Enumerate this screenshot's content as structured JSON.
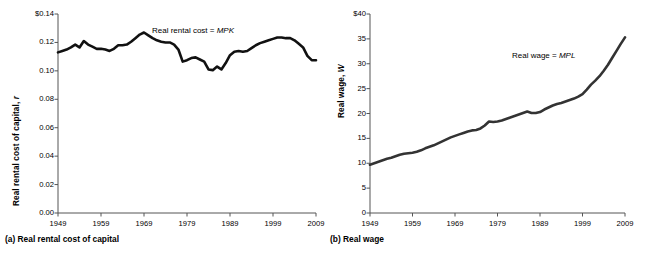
{
  "figure": {
    "background": "#ffffff",
    "line_color": "#1a1a1a",
    "axis_color": "#555555"
  },
  "panels": [
    {
      "id": "a",
      "caption": "(a) Real rental cost of capital",
      "annotation_plain": "Real rental cost = ",
      "annotation_italic": "MPK",
      "ylabel_plain": "Real rental cost of capital, ",
      "ylabel_italic": "r",
      "yticks": [
        "0.00",
        "0.02",
        "0.04",
        "0.06",
        "0.08",
        "0.10",
        "0.12",
        "$0.14"
      ],
      "xticks": [
        "1949",
        "1959",
        "1969",
        "1979",
        "1989",
        "1999",
        "2009"
      ]
    },
    {
      "id": "b",
      "caption": "(b) Real wage",
      "annotation_plain": "Real wage = ",
      "annotation_italic": "MPL",
      "ylabel_plain": "Real wage, ",
      "ylabel_italic": "W",
      "yticks": [
        "0",
        "5",
        "10",
        "15",
        "20",
        "25",
        "30",
        "35",
        "$40"
      ],
      "xticks": [
        "1949",
        "1959",
        "1969",
        "1979",
        "1989",
        "1999",
        "2009"
      ]
    }
  ],
  "chart_data": [
    {
      "type": "line",
      "title": "(a) Real rental cost of capital",
      "xlabel": "",
      "ylabel": "Real rental cost of capital, r",
      "annotation": "Real rental cost = MPK",
      "xlim": [
        1949,
        2009
      ],
      "ylim": [
        0.0,
        0.14
      ],
      "yticks": [
        0.0,
        0.02,
        0.04,
        0.06,
        0.08,
        0.1,
        0.12,
        0.14
      ],
      "xticks": [
        1949,
        1959,
        1969,
        1979,
        1989,
        1999,
        2009
      ],
      "grid": false,
      "legend": "none",
      "series": [
        {
          "name": "Real rental cost of capital",
          "x": [
            1949,
            1950,
            1951,
            1952,
            1953,
            1954,
            1955,
            1956,
            1957,
            1958,
            1959,
            1960,
            1961,
            1962,
            1963,
            1964,
            1965,
            1966,
            1967,
            1968,
            1969,
            1970,
            1971,
            1972,
            1973,
            1974,
            1975,
            1976,
            1977,
            1978,
            1979,
            1980,
            1981,
            1982,
            1983,
            1984,
            1985,
            1986,
            1987,
            1988,
            1989,
            1990,
            1991,
            1992,
            1993,
            1994,
            1995,
            1996,
            1997,
            1998,
            1999,
            2000,
            2001,
            2002,
            2003,
            2004,
            2005,
            2006,
            2007,
            2008,
            2009
          ],
          "y": [
            0.113,
            0.114,
            0.115,
            0.1165,
            0.1185,
            0.1165,
            0.121,
            0.1185,
            0.117,
            0.1155,
            0.1155,
            0.115,
            0.114,
            0.1155,
            0.118,
            0.118,
            0.1185,
            0.1205,
            0.123,
            0.1255,
            0.127,
            0.125,
            0.123,
            0.1215,
            0.1205,
            0.12,
            0.12,
            0.1185,
            0.115,
            0.1065,
            0.1075,
            0.109,
            0.1095,
            0.108,
            0.1065,
            0.101,
            0.1005,
            0.103,
            0.101,
            0.1055,
            0.111,
            0.1135,
            0.114,
            0.1135,
            0.114,
            0.116,
            0.118,
            0.1195,
            0.1205,
            0.1215,
            0.1225,
            0.1235,
            0.1235,
            0.123,
            0.123,
            0.1215,
            0.119,
            0.1165,
            0.1105,
            0.1075,
            0.1075
          ]
        }
      ]
    },
    {
      "type": "line",
      "title": "(b) Real wage",
      "xlabel": "",
      "ylabel": "Real wage, W",
      "annotation": "Real wage = MPL",
      "xlim": [
        1949,
        2009
      ],
      "ylim": [
        0,
        40
      ],
      "yticks": [
        0,
        5,
        10,
        15,
        20,
        25,
        30,
        35,
        40
      ],
      "xticks": [
        1949,
        1959,
        1969,
        1979,
        1989,
        1999,
        2009
      ],
      "grid": false,
      "legend": "none",
      "series": [
        {
          "name": "Real wage",
          "x": [
            1949,
            1950,
            1951,
            1952,
            1953,
            1954,
            1955,
            1956,
            1957,
            1958,
            1959,
            1960,
            1961,
            1962,
            1963,
            1964,
            1965,
            1966,
            1967,
            1968,
            1969,
            1970,
            1971,
            1972,
            1973,
            1974,
            1975,
            1976,
            1977,
            1978,
            1979,
            1980,
            1981,
            1982,
            1983,
            1984,
            1985,
            1986,
            1987,
            1988,
            1989,
            1990,
            1991,
            1992,
            1993,
            1994,
            1995,
            1996,
            1997,
            1998,
            1999,
            2000,
            2001,
            2002,
            2003,
            2004,
            2005,
            2006,
            2007,
            2008,
            2009
          ],
          "y": [
            9.7,
            10.0,
            10.3,
            10.6,
            10.9,
            11.1,
            11.4,
            11.7,
            11.9,
            12.0,
            12.1,
            12.3,
            12.6,
            13.0,
            13.3,
            13.6,
            14.0,
            14.4,
            14.8,
            15.2,
            15.5,
            15.8,
            16.1,
            16.4,
            16.6,
            16.7,
            17.0,
            17.6,
            18.4,
            18.3,
            18.4,
            18.6,
            18.9,
            19.2,
            19.5,
            19.8,
            20.1,
            20.4,
            20.1,
            20.1,
            20.3,
            20.8,
            21.2,
            21.6,
            21.9,
            22.1,
            22.4,
            22.7,
            23.0,
            23.4,
            23.9,
            24.8,
            25.8,
            26.6,
            27.5,
            28.6,
            29.8,
            31.2,
            32.6,
            34.0,
            35.3
          ]
        }
      ]
    }
  ]
}
